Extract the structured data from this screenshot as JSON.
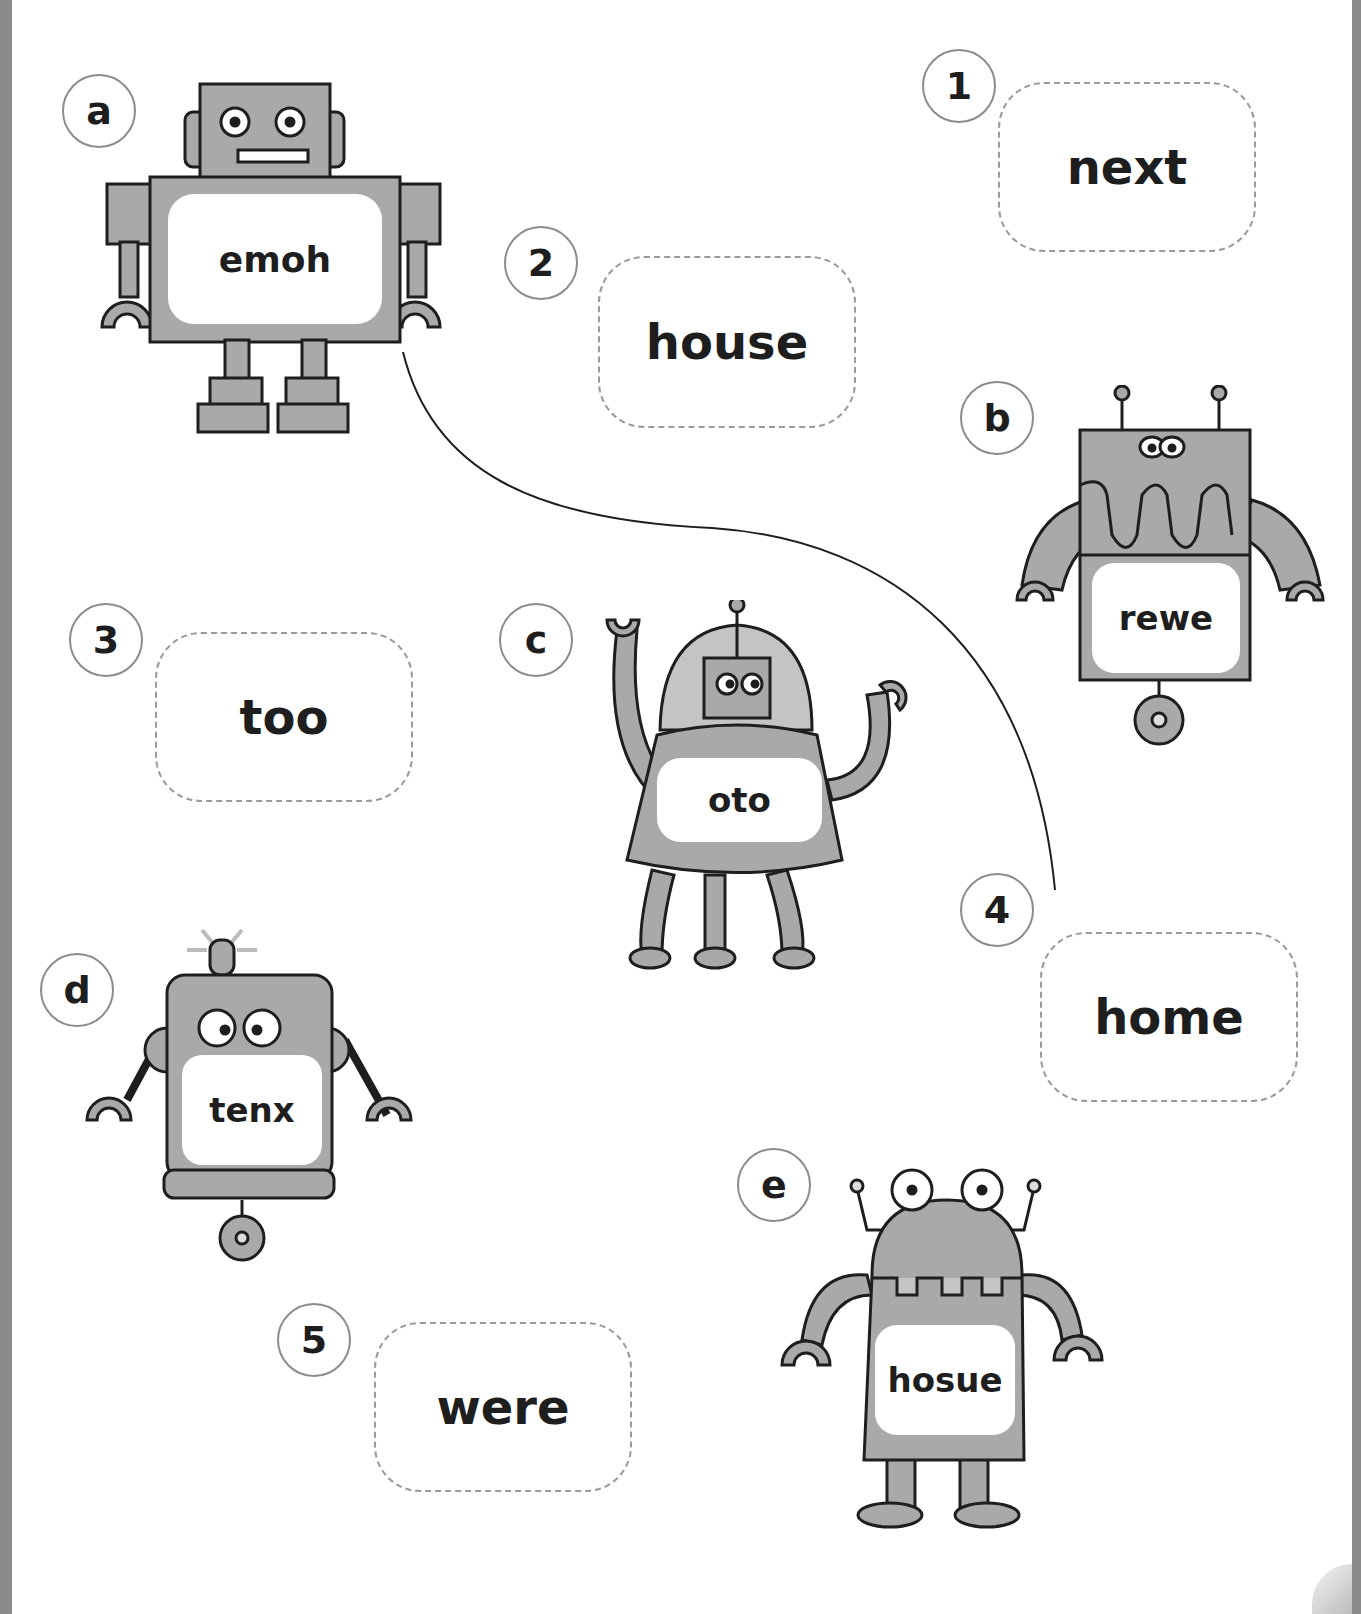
{
  "worksheet": {
    "instruction": "Match each scrambled robot word to the correct word.",
    "robots": [
      {
        "id": "a",
        "scrambled_word": "emoh"
      },
      {
        "id": "b",
        "scrambled_word": "rewe"
      },
      {
        "id": "c",
        "scrambled_word": "oto"
      },
      {
        "id": "d",
        "scrambled_word": "tenx"
      },
      {
        "id": "e",
        "scrambled_word": "hosue"
      }
    ],
    "answers": [
      {
        "number": "1",
        "word": "next"
      },
      {
        "number": "2",
        "word": "house"
      },
      {
        "number": "3",
        "word": "too"
      },
      {
        "number": "4",
        "word": "home"
      },
      {
        "number": "5",
        "word": "were"
      }
    ],
    "drawn_matches": [
      {
        "from_robot": "a",
        "to_answer": "4"
      }
    ]
  },
  "colors": {
    "robot_fill": "#a9a9a9",
    "robot_outline": "#1e1e1e",
    "label_panel": "#ffffff",
    "dashed_border": "#9a9a9a",
    "circle_border": "#8c8c8c",
    "page_edge": "#8a8a8a"
  }
}
